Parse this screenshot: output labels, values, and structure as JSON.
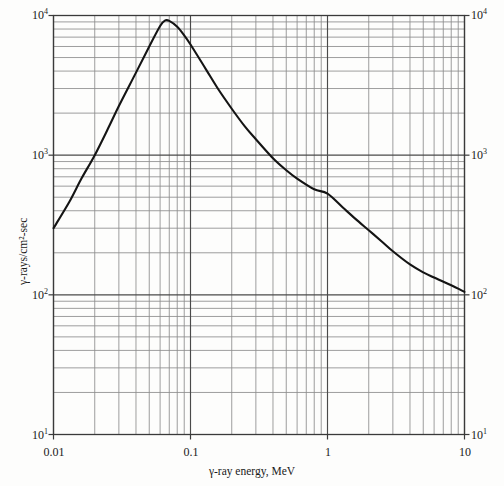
{
  "figure": {
    "background_color": "#fdfdfc",
    "frame_color": "#3a3a3a",
    "grid_color": "#8d8d8d",
    "curve_color": "#141414"
  },
  "axes": {
    "x_title": "γ-ray energy,  MeV",
    "y_title": "γ-rays/cm²-sec",
    "x_tick_labels": [
      "0.01",
      "0.1",
      "1",
      "10"
    ],
    "x_tick_values": [
      0.01,
      0.1,
      1,
      10
    ],
    "y_tick_labels_left": [
      "10⁴",
      "10³",
      "10²",
      "10¹"
    ],
    "y_tick_labels_right": [
      "10⁴",
      "10³",
      "10²",
      "10¹"
    ],
    "y_tick_values": [
      10000,
      1000,
      100,
      10
    ]
  },
  "chart_data": {
    "type": "line",
    "title": "",
    "subtitle": "",
    "xlabel": "γ-ray energy,  MeV",
    "ylabel": "γ-rays/cm²-sec",
    "xscale": "log",
    "yscale": "log",
    "xlim": [
      0.01,
      10
    ],
    "ylim": [
      10,
      10000
    ],
    "grid": true,
    "grid_minor": true,
    "legend": null,
    "legend_position": "none",
    "annotations": [],
    "series": [
      {
        "name": "γ-ray flux spectrum",
        "x": [
          0.01,
          0.013,
          0.016,
          0.02,
          0.025,
          0.03,
          0.04,
          0.05,
          0.06,
          0.065,
          0.07,
          0.08,
          0.09,
          0.1,
          0.13,
          0.16,
          0.2,
          0.25,
          0.3,
          0.4,
          0.5,
          0.6,
          0.8,
          1.0,
          1.3,
          1.6,
          2.0,
          2.5,
          3.0,
          4.0,
          5.0,
          6.0,
          8.0,
          10.0
        ],
        "y": [
          300,
          460,
          680,
          1000,
          1550,
          2250,
          3900,
          6000,
          8400,
          9200,
          9150,
          8300,
          7200,
          6200,
          4100,
          2950,
          2150,
          1600,
          1300,
          950,
          780,
          680,
          570,
          530,
          420,
          350,
          290,
          240,
          205,
          165,
          145,
          133,
          117,
          105
        ]
      }
    ],
    "peak": {
      "x": 0.065,
      "y": 9200
    },
    "endpoints": {
      "start": {
        "x": 0.01,
        "y": 300
      },
      "end": {
        "x": 10,
        "y": 105
      }
    }
  }
}
